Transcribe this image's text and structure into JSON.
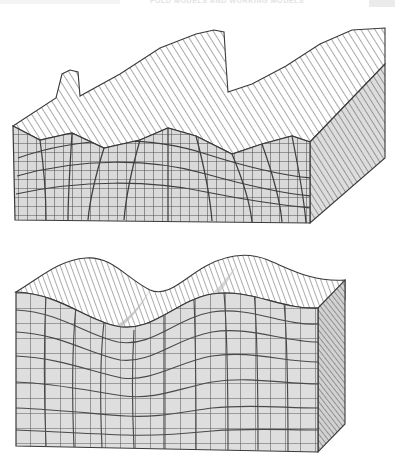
{
  "page": {
    "width": 397,
    "height": 465,
    "background": "#ffffff",
    "kind": "scanned-textbook-figure"
  },
  "running_header": {
    "text": "FOLD MODELS AND WORKING MODELS",
    "visible": "partially cut off at top edge",
    "tab_color": "#ebebec",
    "text_color": "#e2e2e4"
  },
  "figures": [
    {
      "id": "figure-top",
      "name": "fine-mesh-buckled-block",
      "caption": "",
      "description": "Three-dimensional block diagram of a finite-element folding model with a fine deformed quadrilateral mesh on the front and right cut faces and an irregular ridged upper surface rendered with diagonal hatch lines.",
      "surface_type": "irregular-ridged",
      "mesh_density": "fine",
      "crest_count": 3,
      "colors": {
        "mesh_fill": "#d9d9d9",
        "mesh_line": "#4e4e4e",
        "hatch_line": "#8d8d8d",
        "top_surface_fill": "#ffffff",
        "outline": "#3a3a3a",
        "side_face_fill": "#c9c9c9"
      },
      "geometry": {
        "front_top_left": [
          13,
          118
        ],
        "front_bottom_left": [
          15,
          212
        ],
        "front_bottom_right": [
          310,
          215
        ],
        "right_back_top": [
          385,
          20
        ],
        "top_surface_crest_y": 22,
        "trough_y": 118
      }
    },
    {
      "id": "figure-bottom",
      "name": "coarse-mesh-sinusoidal-block",
      "caption": "",
      "description": "Three-dimensional block diagram of a folding model with smooth sinusoidal folds, a coarser curved quadrilateral mesh on the front face and closely spaced diagonal hatch lines on the folded upper surface and right side face.",
      "surface_type": "smooth-sinusoidal",
      "mesh_density": "coarse",
      "crest_count": 3,
      "colors": {
        "mesh_fill": "#dedede",
        "mesh_line": "#595959",
        "hatch_line": "#7f7f7f",
        "top_surface_fill": "#ffffff",
        "outline": "#3a3a3a",
        "side_face_fill": "#c4c4c4"
      },
      "geometry": {
        "front_top_left": [
          16,
          292
        ],
        "front_bottom_left": [
          16,
          446
        ],
        "front_bottom_right": [
          318,
          452
        ],
        "right_back_top": [
          345,
          300
        ],
        "top_surface_crest_y": 258,
        "trough_y": 300
      }
    }
  ]
}
